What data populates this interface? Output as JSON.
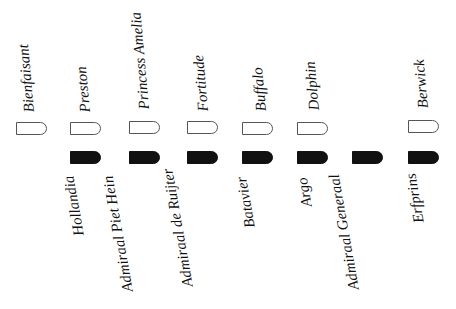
{
  "top_row": [
    {
      "name": "Bienfaisant",
      "x": 16
    },
    {
      "name": "Preston",
      "x": 70
    },
    {
      "name": "Princess Amelia",
      "x": 129
    },
    {
      "name": "Fortitude",
      "x": 187
    },
    {
      "name": "Buffalo",
      "x": 242
    },
    {
      "name": "Dolphin",
      "x": 297
    },
    {
      "name": "Berwick",
      "x": 408
    }
  ],
  "bottom_row": [
    {
      "name": "Hollandia",
      "x": 70
    },
    {
      "name": "Admiraal Piet Hein",
      "x": 129
    },
    {
      "name": "Admiraal de Ruijter",
      "x": 187
    },
    {
      "name": "Batavier",
      "x": 242
    },
    {
      "name": "Argo",
      "x": 297
    },
    {
      "name": "Admiraal Generaal",
      "x": 352
    },
    {
      "name": "Erfprins",
      "x": 408
    }
  ],
  "legend": {
    "outline_shape": "British ship",
    "filled_shape": "Dutch ship"
  },
  "colors": {
    "filled": "#111111",
    "outline": "#555555"
  }
}
